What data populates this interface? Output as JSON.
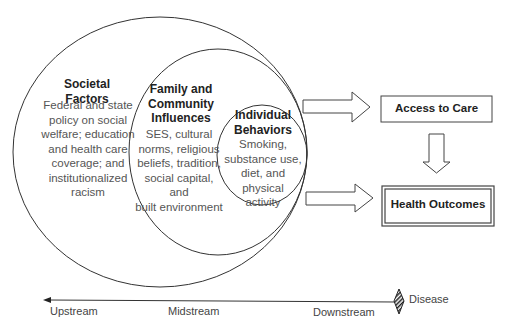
{
  "circles": {
    "societal": {
      "title": "Societal Factors",
      "lines": [
        "Federal and state",
        "policy on social",
        "welfare; education",
        "and health care",
        "coverage; and",
        "institutionalized",
        "racism"
      ]
    },
    "family": {
      "title_lines": [
        "Family and",
        "Community",
        "Influences"
      ],
      "lines": [
        "SES, cultural",
        "norms, religious",
        "beliefs, tradition,",
        "social capital, and",
        "built environment"
      ]
    },
    "individual": {
      "title_lines": [
        "Individual",
        "Behaviors"
      ],
      "lines": [
        "Smoking,",
        "substance use,",
        "diet, and",
        "physical",
        "activity"
      ]
    }
  },
  "boxes": {
    "access": "Access to Care",
    "outcomes": "Health Outcomes"
  },
  "axis": {
    "upstream": "Upstream",
    "midstream": "Midstream",
    "downstream": "Downstream",
    "disease": "Disease"
  },
  "colors": {
    "line": "#333333",
    "text": "#555555",
    "title": "#222222"
  }
}
